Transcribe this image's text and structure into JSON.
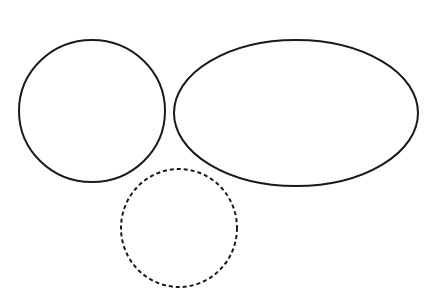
{
  "canvas": {
    "width": 437,
    "height": 288,
    "background_color": "#ffffff",
    "title": "Three overlapping outline shapes diagram"
  },
  "style": {
    "stroke_color": "#1a1a1a",
    "stroke_width": 2,
    "fill": "none",
    "dash_pattern": "4 3"
  },
  "shapes": [
    {
      "id": "left-circle",
      "label": "Left circle",
      "type": "ellipse",
      "line_style": "solid",
      "stroke_color": "#1a1a1a",
      "stroke_width": 2,
      "fill": "none",
      "cx": 92,
      "cy": 111,
      "rx": 73,
      "ry": 71,
      "bounds": {
        "left": 19,
        "top": 40,
        "right": 165,
        "bottom": 182
      }
    },
    {
      "id": "right-ellipse",
      "label": "Right wide ellipse",
      "type": "ellipse",
      "line_style": "solid",
      "stroke_color": "#1a1a1a",
      "stroke_width": 2,
      "fill": "none",
      "cx": 296,
      "cy": 113,
      "rx": 122,
      "ry": 73,
      "bounds": {
        "left": 174,
        "top": 40,
        "right": 418,
        "bottom": 186
      }
    },
    {
      "id": "dashed-ellipse",
      "label": "Lower dashed ellipse",
      "type": "ellipse",
      "line_style": "dashed",
      "stroke_color": "#1a1a1a",
      "stroke_width": 2,
      "fill": "none",
      "dash_pattern": "4 3",
      "cx": 179,
      "cy": 228,
      "rx": 58,
      "ry": 59,
      "bounds": {
        "left": 121,
        "top": 169,
        "right": 237,
        "bottom": 287
      },
      "clipped_at_bottom": true
    }
  ]
}
